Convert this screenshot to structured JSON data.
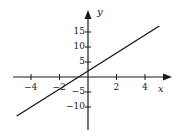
{
  "chart_data": {
    "type": "line",
    "title": "",
    "xlabel": "x",
    "ylabel": "y",
    "xlim": [
      -5,
      5.8
    ],
    "ylim": [
      -17,
      22
    ],
    "grid": false,
    "legend": null,
    "x_ticks": [
      -4,
      -2,
      2,
      4
    ],
    "y_ticks": [
      -10,
      -5,
      5,
      10,
      15
    ],
    "x_tick_labels": [
      "−4",
      "−2",
      "2",
      "4"
    ],
    "y_tick_labels": [
      "−10",
      "−5",
      "5",
      "10",
      "15"
    ],
    "series": [
      {
        "name": "y = 3x + 2",
        "equation": "y = 3x + 2",
        "x": [
          -5,
          5
        ],
        "y": [
          -13,
          17
        ]
      }
    ]
  },
  "labels": {
    "x_axis": "x",
    "y_axis": "y"
  },
  "colors": {
    "line": "#1a1a1a",
    "axes": "#1a1a1a",
    "background": "#ffffff"
  }
}
